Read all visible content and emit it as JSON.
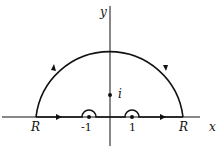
{
  "diagram": {
    "type": "contour-integration",
    "axes": {
      "x_label": "x",
      "y_label": "y"
    },
    "contour": {
      "description": "Upper semicircle of radius R with small semicircular indentations above poles at -1 and 1",
      "radius_label_left": "R",
      "radius_label_right": "R",
      "direction": "counterclockwise"
    },
    "points": [
      {
        "label": "-1",
        "kind": "pole",
        "indented": true
      },
      {
        "label": "1",
        "kind": "pole",
        "indented": true
      },
      {
        "label": "i",
        "kind": "pole",
        "indented": false
      }
    ],
    "colors": {
      "stroke": "#111111",
      "background": "#ffffff"
    }
  }
}
